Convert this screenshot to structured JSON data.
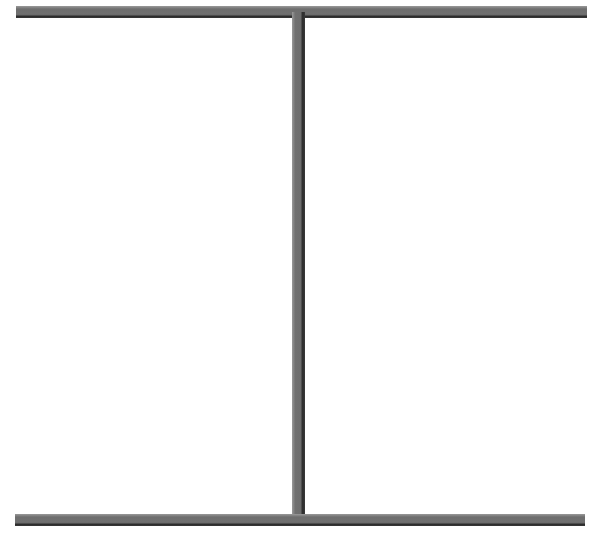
{
  "diagram": {
    "shape": "I-beam",
    "colors": {
      "fill": "#707070",
      "edge": "#2b2b2b",
      "background": "#ffffff"
    },
    "elements": {
      "top_bar": {
        "x": 16,
        "y": 6,
        "width": 571,
        "height": 12
      },
      "vertical_post": {
        "x": 292,
        "y": 12,
        "width": 13,
        "height": 508
      },
      "bottom_bar": {
        "x": 15,
        "y": 514,
        "width": 570,
        "height": 12
      }
    }
  }
}
